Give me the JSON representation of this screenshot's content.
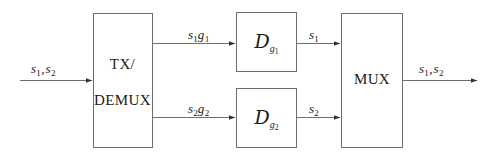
{
  "diagram": {
    "background_color": "#ffffff",
    "line_color": "#6e6e6e",
    "text_color": "#1a1a1a",
    "blocks": [
      {
        "id": "tx-demux",
        "name": "TX/DEMUX",
        "label_line1": "TX/",
        "label_line2": "DEMUX",
        "x": 93,
        "y": 13,
        "width": 59,
        "height": 135
      },
      {
        "id": "decoder-1",
        "name": "Decoder g1",
        "label_base": "D",
        "label_sub": "g",
        "label_sub_index": "1",
        "x": 236,
        "y": 12,
        "width": 61,
        "height": 60
      },
      {
        "id": "decoder-2",
        "name": "Decoder g2",
        "label_base": "D",
        "label_sub": "g",
        "label_sub_index": "2",
        "x": 236,
        "y": 88,
        "width": 61,
        "height": 60
      },
      {
        "id": "mux",
        "name": "MUX",
        "label_line1": "MUX",
        "x": 341,
        "y": 13,
        "width": 62,
        "height": 135
      }
    ],
    "signals": [
      {
        "id": "input-signal",
        "name": "input s1 s2",
        "base1": "s",
        "sub1": "1",
        "separator": ",",
        "base2": "s",
        "sub2": "2",
        "label_x": 31,
        "label_y": 62,
        "line_x1": 20,
        "line_x2": 93,
        "line_y": 80
      },
      {
        "id": "tx-to-decoder1",
        "name": "s1 g1",
        "base1": "s",
        "sub1": "1",
        "base2": "g",
        "sub2": "1",
        "label_x": 188,
        "label_y": 28,
        "line_x1": 152,
        "line_x2": 236,
        "line_y": 43
      },
      {
        "id": "tx-to-decoder2",
        "name": "s2 g2",
        "base1": "s",
        "sub1": "2",
        "base2": "g",
        "sub2": "2",
        "label_x": 188,
        "label_y": 102,
        "line_x1": 152,
        "line_x2": 236,
        "line_y": 117
      },
      {
        "id": "decoder1-to-mux",
        "name": "s1",
        "base1": "s",
        "sub1": "1",
        "label_x": 309,
        "label_y": 28,
        "line_x1": 297,
        "line_x2": 341,
        "line_y": 43
      },
      {
        "id": "decoder2-to-mux",
        "name": "s2",
        "base1": "s",
        "sub1": "2",
        "label_x": 309,
        "label_y": 102,
        "line_x1": 297,
        "line_x2": 341,
        "line_y": 117
      },
      {
        "id": "output-signal",
        "name": "output s1 s2",
        "base1": "s",
        "sub1": "1",
        "separator": ",",
        "base2": "s",
        "sub2": "2",
        "label_x": 419,
        "label_y": 62,
        "line_x1": 403,
        "line_x2": 478,
        "line_y": 80
      }
    ]
  }
}
